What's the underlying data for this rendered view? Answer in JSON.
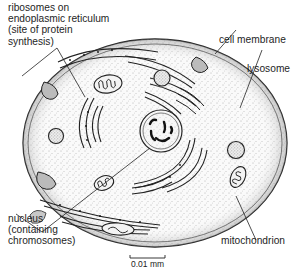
{
  "figure": {
    "type": "cell diagram (animal cell cross-section)",
    "labels": {
      "ribosomes": "ribosomes on\nendoplasmic reticulum\n(site of protein\nsynthesis)",
      "cell_membrane": "cell membrane",
      "lysosome": "lysosome",
      "nucleus": "nucleus\n(containing\nchromosomes)",
      "mitochondrion": "mitochondrion"
    },
    "scale_bar": {
      "label": "0.01 mm"
    },
    "caption": {
      "visible_text": ""
    },
    "colors": {
      "ink": "#1e1e1e",
      "stipple": "#555555",
      "background": "#ffffff"
    }
  }
}
